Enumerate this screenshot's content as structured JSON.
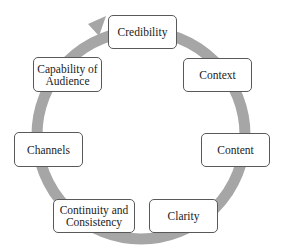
{
  "diagram": {
    "type": "cycle",
    "ring_color": "#a6a6a6",
    "node_border_color": "#595959",
    "nodes": [
      {
        "label": "Credibility"
      },
      {
        "label": "Context"
      },
      {
        "label": "Content"
      },
      {
        "label": "Clarity"
      },
      {
        "label": "Continuity and Consistency"
      },
      {
        "label": "Channels"
      },
      {
        "label": "Capability of Audience"
      }
    ]
  }
}
